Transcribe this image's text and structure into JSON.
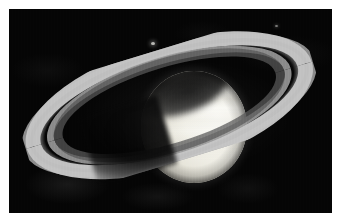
{
  "image": {
    "subject": "Saturn",
    "type": "astronomical-photograph",
    "alt_text": "Telescope image of the planet Saturn with its ring system tilted, shown against a black sky inside a white border",
    "caption": "",
    "frame": {
      "border_color": "#ffffff",
      "border_width_px": 9,
      "background_color": "#050505",
      "plate_width_px": 323,
      "plate_height_px": 204
    }
  },
  "scene": {
    "planet": {
      "name": "Saturn",
      "label": "planet-disk",
      "highlight_color": "#fbfbf7",
      "midtone_color": "#e6e4d9",
      "terminator_color": "#2b2b28",
      "tilt_degrees": -17
    },
    "rings": {
      "label": "ring-system",
      "tilt_degrees": -17,
      "bands": [
        {
          "name": "A ring",
          "color": "#969696"
        },
        {
          "name": "Cassini division",
          "color": "#101010"
        },
        {
          "name": "B ring",
          "color": "#c4c4c4"
        },
        {
          "name": "B ring inner",
          "color": "#969696"
        },
        {
          "name": "C ring",
          "color": "#565656"
        }
      ]
    },
    "shadows": [
      {
        "name": "ring-shadow-on-planet",
        "color": "#0a0a0a"
      },
      {
        "name": "planet-shadow-on-rings",
        "color": "#040404"
      }
    ],
    "moons": [
      {
        "name": "moon-1",
        "color": "#d9d9d4"
      },
      {
        "name": "moon-2",
        "color": "#d9d9d4"
      }
    ]
  }
}
